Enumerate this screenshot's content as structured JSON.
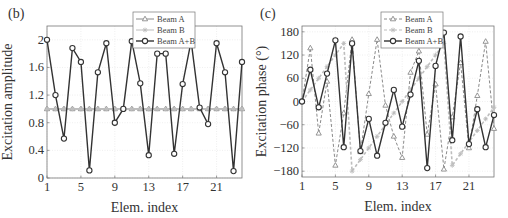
{
  "chart_data": [
    {
      "type": "line",
      "panel_label": "(b)",
      "title": "",
      "xlabel": "Elem. index",
      "ylabel": "Excitation amplitude",
      "xlim": [
        1,
        24
      ],
      "ylim": [
        0,
        2.2
      ],
      "xticks": [
        1,
        5,
        9,
        13,
        17,
        21
      ],
      "yticks": [
        0,
        0.4,
        0.8,
        1.2,
        1.6,
        2
      ],
      "ytick_labels": [
        "0",
        "0.4",
        "0.8",
        "1.2",
        "1.6",
        "2"
      ],
      "grid": true,
      "legend_position": "top-center",
      "x": [
        1,
        2,
        3,
        4,
        5,
        6,
        7,
        8,
        9,
        10,
        11,
        12,
        13,
        14,
        15,
        16,
        17,
        18,
        19,
        20,
        21,
        22,
        23,
        24
      ],
      "series": [
        {
          "name": "Beam A",
          "style": "solid",
          "marker": "triangle",
          "color": "#8a8a8a",
          "values": [
            1,
            1,
            1,
            1,
            1,
            1,
            1,
            1,
            1,
            1,
            1,
            1,
            1,
            1,
            1,
            1,
            1,
            1,
            1,
            1,
            1,
            1,
            1,
            1
          ]
        },
        {
          "name": "Beam B",
          "style": "solid",
          "marker": "star",
          "color": "#bdbdbd",
          "values": [
            1,
            1,
            1,
            1,
            1,
            1,
            1,
            1,
            1,
            1,
            1,
            1,
            1,
            1,
            1,
            1,
            1,
            1,
            1,
            1,
            1,
            1,
            1,
            1
          ]
        },
        {
          "name": "Beam A+B",
          "style": "solid",
          "marker": "circle",
          "color": "#333333",
          "values": [
            2.0,
            1.2,
            0.57,
            1.88,
            1.68,
            0.11,
            1.53,
            1.95,
            0.8,
            1.0,
            1.98,
            1.37,
            0.33,
            1.8,
            1.8,
            0.35,
            1.36,
            1.98,
            1.02,
            0.78,
            1.95,
            1.53,
            0.1,
            1.68
          ]
        }
      ]
    },
    {
      "type": "line",
      "panel_label": "(c)",
      "title": "",
      "xlabel": "Elem. index",
      "ylabel": "Excitation phase (°)",
      "xlim": [
        1,
        24
      ],
      "ylim": [
        -195,
        195
      ],
      "xticks": [
        1,
        5,
        9,
        13,
        17,
        21
      ],
      "yticks": [
        -180,
        -120,
        -60,
        0,
        60,
        120,
        180
      ],
      "ytick_labels": [
        "−180",
        "−120",
        "−60",
        "0",
        "60",
        "120",
        "180"
      ],
      "grid": true,
      "legend_position": "top-center",
      "x": [
        1,
        2,
        3,
        4,
        5,
        6,
        7,
        8,
        9,
        10,
        11,
        12,
        13,
        14,
        15,
        16,
        17,
        18,
        19,
        20,
        21,
        22,
        23,
        24
      ],
      "series": [
        {
          "name": "Beam A",
          "style": "dashed",
          "marker": "triangle",
          "color": "#8a8a8a",
          "values": [
            0,
            138,
            -82,
            52,
            -165,
            -30,
            160,
            -130,
            20,
            160,
            -10,
            -90,
            -145,
            75,
            130,
            -85,
            45,
            -175,
            -40,
            100,
            -120,
            15,
            155,
            -70
          ]
        },
        {
          "name": "Beam B",
          "style": "dashed",
          "marker": "star",
          "color": "#bdbdbd",
          "values": [
            0,
            30,
            60,
            90,
            120,
            150,
            -180,
            -150,
            -120,
            -90,
            -60,
            -30,
            0,
            30,
            60,
            90,
            120,
            150,
            -165,
            -135,
            -105,
            -75,
            -45,
            -15
          ]
        },
        {
          "name": "Beam A+B",
          "style": "solid",
          "marker": "circle",
          "color": "#333333",
          "values": [
            0,
            82,
            -15,
            72,
            158,
            -118,
            150,
            -128,
            -45,
            -140,
            -55,
            30,
            -65,
            18,
            105,
            -172,
            92,
            178,
            -100,
            168,
            -110,
            -20,
            -118,
            -35
          ]
        }
      ]
    }
  ]
}
